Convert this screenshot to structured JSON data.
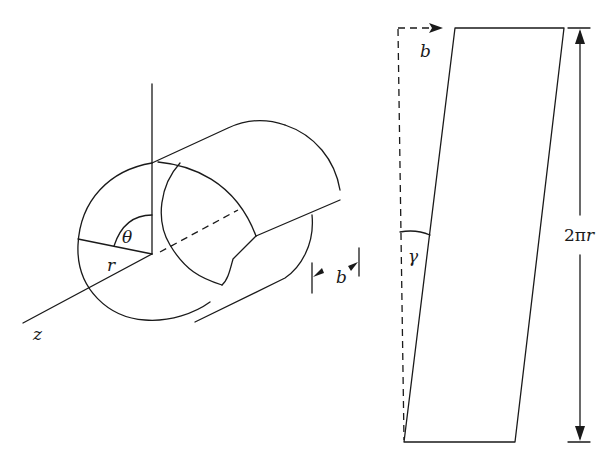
{
  "figure": {
    "colors": {
      "line": "#1a1a1a",
      "background": "#ffffff"
    }
  },
  "left_panel": {
    "name": "cylinder",
    "labels": {
      "theta": "θ",
      "radius": "r",
      "axis": "z",
      "burgers": "b"
    }
  },
  "right_panel": {
    "name": "unrolled-sheet",
    "labels": {
      "burgers": "b",
      "shear_angle": "γ",
      "height_prefix": "2π",
      "height_var": "r"
    }
  }
}
